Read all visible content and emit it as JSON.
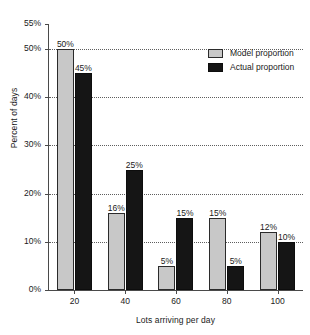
{
  "chart_data": {
    "type": "bar",
    "title": "",
    "xlabel": "Lots arriving per day",
    "ylabel": "Percent of days",
    "categories": [
      "20",
      "40",
      "60",
      "80",
      "100"
    ],
    "series": [
      {
        "name": "Model proportion",
        "color": "#c8c8c8",
        "values": [
          50,
          16,
          5,
          15,
          12
        ],
        "value_labels": [
          "50%",
          "16%",
          "5%",
          "15%",
          "12%"
        ]
      },
      {
        "name": "Actual proportion",
        "color": "#151515",
        "values": [
          45,
          25,
          15,
          5,
          10
        ],
        "value_labels": [
          "45%",
          "25%",
          "15%",
          "5%",
          "10%"
        ]
      }
    ],
    "ylim": [
      0,
      55
    ],
    "yticks": [
      0,
      10,
      20,
      30,
      40,
      50,
      55
    ],
    "ytick_labels": [
      "0%",
      "10%",
      "20%",
      "30%",
      "40%",
      "50%",
      "55%"
    ],
    "gridlines": [
      10,
      20,
      30,
      40,
      50
    ],
    "grid": true,
    "legend_position": "top-right"
  },
  "legend": {
    "items": [
      {
        "label": "Model proportion"
      },
      {
        "label": "Actual proportion"
      }
    ]
  }
}
